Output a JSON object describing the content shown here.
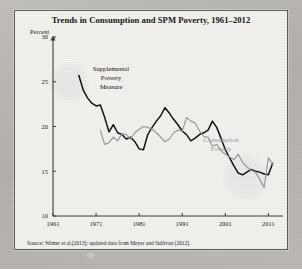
{
  "figure": {
    "title": "Trends in Consumption and SPM Poverty, 1961–2012",
    "y_axis_label": "Percent",
    "source_note": "Source: Wimer et al.(2013); updated data from Meyer and Sullivan (2012).",
    "annotations": {
      "spm_line1": "Supplemental",
      "spm_line2": "Poverty",
      "spm_line3": "Measure",
      "consumption_line1": "Consumption",
      "consumption_line2": "Poverty"
    },
    "colors": {
      "spm_series": "#111111",
      "consumption_series": "#9a9a9a",
      "axis": "#3c3a36",
      "panel_background": "#f2f1ee",
      "page_background": "#b9b6b1"
    }
  },
  "chart_data": {
    "type": "line",
    "title": "Trends in Consumption and SPM Poverty, 1961–2012",
    "xlabel": "",
    "ylabel": "Percent",
    "xlim": [
      1961,
      2013
    ],
    "ylim": [
      10,
      30
    ],
    "grid": false,
    "legend_position": "inline-annotation",
    "xticks": [
      1961,
      1971,
      1981,
      1991,
      2001,
      2011
    ],
    "xticklabels": [
      "1961",
      "1971",
      "1981",
      "1991",
      "2001",
      "2011"
    ],
    "yticks": [
      10,
      15,
      20,
      25,
      30
    ],
    "yticklabels": [
      "10",
      "15",
      "20",
      "25",
      "30"
    ],
    "series": [
      {
        "name": "Supplemental Poverty Measure",
        "color": "#111111",
        "x": [
          1967,
          1968,
          1969,
          1970,
          1971,
          1972,
          1973,
          1974,
          1975,
          1976,
          1977,
          1978,
          1979,
          1980,
          1981,
          1982,
          1983,
          1984,
          1985,
          1986,
          1987,
          1988,
          1989,
          1990,
          1991,
          1992,
          1993,
          1994,
          1995,
          1996,
          1997,
          1998,
          1999,
          2000,
          2001,
          2002,
          2003,
          2004,
          2005,
          2006,
          2007,
          2008,
          2009,
          2010,
          2011,
          2012
        ],
        "values": [
          25.7,
          24.1,
          23.2,
          22.6,
          22.3,
          22.4,
          21.0,
          19.4,
          20.2,
          19.3,
          19.1,
          18.6,
          18.8,
          18.3,
          17.5,
          17.4,
          19.1,
          19.9,
          20.6,
          21.2,
          22.1,
          21.5,
          20.8,
          20.2,
          19.5,
          19.1,
          18.4,
          18.7,
          19.1,
          19.3,
          19.6,
          20.6,
          19.9,
          18.7,
          17.4,
          16.5,
          15.6,
          14.8,
          14.6,
          14.9,
          15.2,
          15.0,
          14.9,
          14.7,
          14.6,
          15.9
        ]
      },
      {
        "name": "Consumption Poverty",
        "color": "#9a9a9a",
        "x": [
          1972,
          1973,
          1974,
          1975,
          1976,
          1977,
          1978,
          1979,
          1980,
          1981,
          1982,
          1983,
          1984,
          1985,
          1986,
          1987,
          1988,
          1989,
          1990,
          1991,
          1992,
          1993,
          1994,
          1995,
          1996,
          1997,
          1998,
          1999,
          2000,
          2001,
          2002,
          2003,
          2004,
          2005,
          2006,
          2007,
          2008,
          2009,
          2010,
          2011,
          2012
        ],
        "values": [
          19.6,
          18.0,
          18.2,
          18.8,
          18.4,
          19.2,
          19.1,
          18.6,
          19.3,
          19.7,
          20.0,
          19.9,
          19.7,
          19.3,
          18.8,
          18.3,
          18.6,
          19.3,
          19.6,
          19.5,
          21.0,
          20.6,
          20.4,
          19.5,
          18.9,
          18.8,
          17.8,
          18.0,
          17.3,
          16.9,
          16.6,
          16.3,
          16.9,
          16.0,
          15.5,
          15.1,
          14.9,
          14.1,
          13.2,
          16.5,
          15.8
        ]
      }
    ]
  }
}
